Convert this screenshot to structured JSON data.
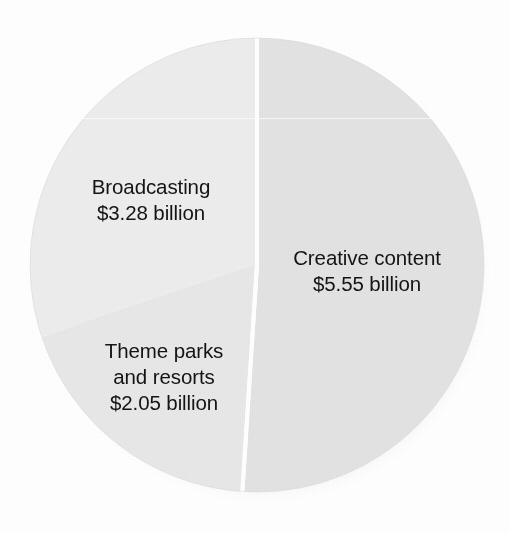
{
  "figure": {
    "background_color": "#ffffff",
    "label_text_color": "#141414",
    "divider_color": "#ffffff"
  },
  "pie": {
    "center_x": 257,
    "center_y": 265,
    "radius": 227,
    "start_angle_deg": 0,
    "direction": "clockwise",
    "divider_width_px": 4,
    "shadow": "soft drop shadow lower-right"
  },
  "labels": {
    "broadcasting": {
      "line1": "Broadcasting",
      "line2": "$3.28 billion"
    },
    "creative": {
      "line1": "Creative content",
      "line2": "$5.55 billion"
    },
    "themeparks": {
      "line1": "Theme parks",
      "line2": "and resorts",
      "line3": "$2.05 billion"
    }
  },
  "chart_data": {
    "type": "pie",
    "title": "",
    "subtitle": "",
    "xlabel": "",
    "ylabel": "",
    "unit": "billion USD",
    "total": 10.88,
    "legend": "none (direct slice labels)",
    "grid": false,
    "categories": [
      "Creative content",
      "Broadcasting",
      "Theme parks and resorts"
    ],
    "values": [
      5.55,
      3.28,
      2.05
    ],
    "value_labels": [
      "$5.55 billion",
      "$3.28 billion",
      "$2.05 billion"
    ],
    "percentages": [
      51.0,
      30.1,
      18.8
    ],
    "slices": [
      {
        "name": "Creative content",
        "value": 5.55,
        "value_label": "$5.55 billion",
        "percent": 51.0,
        "start_angle_deg": 0,
        "end_angle_deg": 183.7,
        "color": "#e3e3e3"
      },
      {
        "name": "Broadcasting",
        "value": 3.28,
        "value_label": "$3.28 billion",
        "percent": 30.1,
        "start_angle_deg": 251.5,
        "end_angle_deg": 360,
        "color": "#ededed"
      },
      {
        "name": "Theme parks and resorts",
        "value": 2.05,
        "value_label": "$2.05 billion",
        "percent": 18.8,
        "start_angle_deg": 183.7,
        "end_angle_deg": 251.5,
        "color": "#e8e8e8"
      }
    ]
  }
}
